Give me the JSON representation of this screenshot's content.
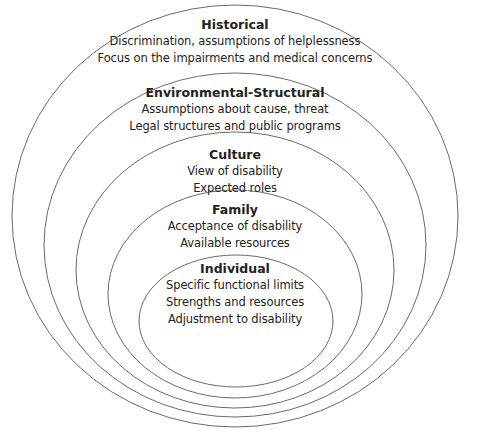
{
  "diagram": {
    "type": "nested-ellipses",
    "stroke_color": "#6a6a6a",
    "levels": [
      {
        "title": "Historical",
        "lines": [
          "Discrimination, assumptions of helplessness",
          "Focus on the impairments and medical concerns"
        ]
      },
      {
        "title": "Environmental-Structural",
        "lines": [
          "Assumptions about cause, threat",
          "Legal structures and public programs"
        ]
      },
      {
        "title": "Culture",
        "lines": [
          "View of disability",
          "Expected roles"
        ]
      },
      {
        "title": "Family",
        "lines": [
          "Acceptance of disability",
          "Available resources"
        ]
      },
      {
        "title": "Individual",
        "lines": [
          "Specific functional limits",
          "Strengths and resources",
          "Adjustment to disability"
        ]
      }
    ]
  }
}
